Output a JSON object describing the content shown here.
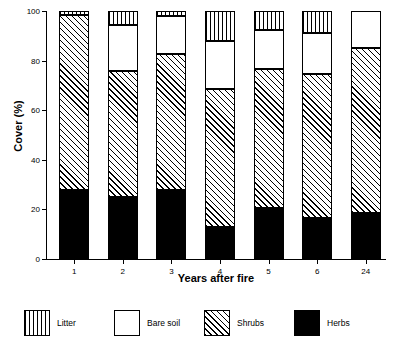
{
  "chart_data": {
    "type": "bar",
    "stacked": true,
    "title": "",
    "subtitle": "",
    "xlabel": "Years after fire",
    "ylabel": "Cover (%)",
    "categories": [
      "1",
      "2",
      "3",
      "4",
      "5",
      "6",
      "24"
    ],
    "ylim": [
      0,
      100
    ],
    "yticks": [
      0,
      20,
      40,
      60,
      80,
      100
    ],
    "ytick_labels": [
      "0",
      "20",
      "40",
      "60",
      "80",
      "100"
    ],
    "grid": false,
    "legend_position": "bottom",
    "series": [
      {
        "name": "Herbs",
        "fill": "solid-black",
        "color": "#000000",
        "values": [
          28,
          25,
          28,
          13,
          20.5,
          16.5,
          18.5
        ]
      },
      {
        "name": "Shrubs",
        "fill": "diagonal-hatch",
        "color": "#ffffff",
        "values": [
          70.5,
          51,
          54.5,
          55.5,
          56,
          58,
          66.5
        ]
      },
      {
        "name": "Bare soil",
        "fill": "empty-white",
        "color": "#ffffff",
        "values": [
          0,
          18.5,
          15.5,
          19.5,
          16,
          16.5,
          15
        ]
      },
      {
        "name": "Litter",
        "fill": "vertical-hatch",
        "color": "#ffffff",
        "values": [
          1.5,
          5.5,
          2,
          12,
          7.5,
          9,
          0
        ]
      }
    ],
    "stack_order_bottom_to_top": [
      "Herbs",
      "Shrubs",
      "Bare soil",
      "Litter"
    ]
  },
  "legend": {
    "items": [
      {
        "label": "Litter",
        "swatch": "vertical-hatch"
      },
      {
        "label": "Bare soil",
        "swatch": "empty-white"
      },
      {
        "label": "Shrubs",
        "swatch": "diagonal-hatch"
      },
      {
        "label": "Herbs",
        "swatch": "solid-black"
      }
    ]
  }
}
